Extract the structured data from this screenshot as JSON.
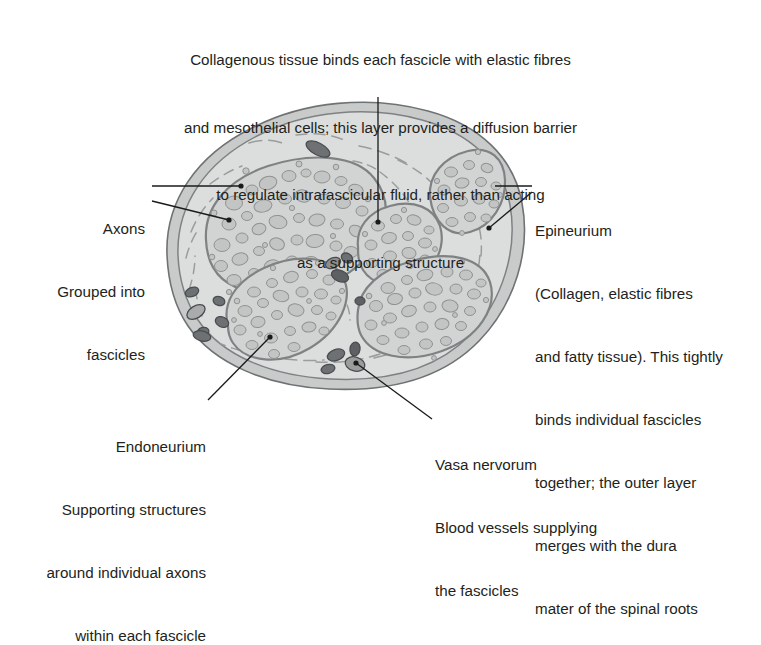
{
  "figure": {
    "background_color": "#ffffff",
    "text_color": "#231f20"
  },
  "caption_top": {
    "name": "collagenous-tissue-caption",
    "lines": [
      "Collagenous tissue binds each fascicle with elastic fibres",
      "and mesothelial cells; this layer provides a diffusion barrier",
      "to regulate intrafascicular fluid, rather than acting",
      "as a supporting structure"
    ]
  },
  "annotations": {
    "axons": {
      "name": "axons-annotation",
      "lines": [
        "Axons",
        "Grouped into",
        "fascicles"
      ],
      "align": "right"
    },
    "epineurium": {
      "name": "epineurium-annotation",
      "lines": [
        "Epineurium",
        "(Collagen, elastic fibres",
        "and fatty tissue). This tightly",
        "binds individual fascicles",
        "together; the outer layer",
        "merges with the dura",
        "mater of the spinal roots"
      ],
      "align": "left"
    },
    "endoneurium": {
      "name": "endoneurium-annotation",
      "lines": [
        "Endoneurium",
        "Supporting structures",
        "around individual axons",
        "within each fascicle"
      ],
      "align": "right"
    },
    "vasa_nervorum": {
      "name": "vasa-nervorum-annotation",
      "lines": [
        "Vasa nervorum",
        "Blood vessels supplying",
        "the fascicles"
      ],
      "align": "left"
    }
  },
  "diagram": {
    "name": "nerve-cross-section-diagram",
    "colors": {
      "outer_rim": "#8e9092",
      "epineurium_fill": "#d7d9d8",
      "interior_fill": "#dcdedd",
      "fascicle_fill": "#d2d4d3",
      "fascicle_stroke": "#8a8c8c",
      "axon_fill": "#c2c5c4",
      "axon_stroke": "#939695",
      "vessel_fill": "#6e7173",
      "vessel_stroke": "#4b4e50",
      "leader_line": "#1a1a1a"
    },
    "fascicle_count": 5,
    "fascicles": [
      {
        "label": "upper-left-fascicle"
      },
      {
        "label": "middle-small-fascicle"
      },
      {
        "label": "upper-right-fascicle"
      },
      {
        "label": "lower-right-fascicle"
      },
      {
        "label": "lower-left-fascicle"
      }
    ],
    "structures": [
      "epineurium",
      "perineurium",
      "endoneurium",
      "axons",
      "vasa nervorum"
    ]
  }
}
